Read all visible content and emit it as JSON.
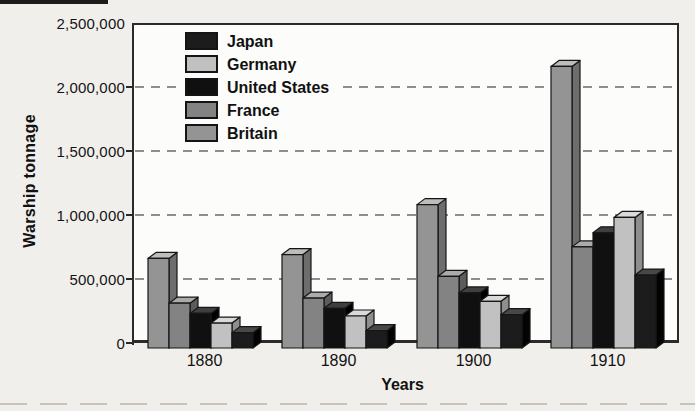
{
  "chart_data": {
    "type": "bar",
    "title": "",
    "xlabel": "Years",
    "ylabel": "Warship tonnage",
    "ylim": [
      0,
      2500000
    ],
    "grid": "horizontal-dashed",
    "legend_position": "top-left-inside",
    "yticks": [
      {
        "value": 0,
        "label": "0"
      },
      {
        "value": 500000,
        "label": "500,000"
      },
      {
        "value": 1000000,
        "label": "1,000,000"
      },
      {
        "value": 1500000,
        "label": "1,500,000"
      },
      {
        "value": 2000000,
        "label": "2,000,000"
      },
      {
        "value": 2500000,
        "label": "2,500,000"
      }
    ],
    "categories": [
      "1880",
      "1890",
      "1900",
      "1910"
    ],
    "series": [
      {
        "name": "Britain",
        "color_front": "#949494",
        "color_top": "#bdbdbd",
        "color_side": "#6d6d6d",
        "values": [
          700000,
          730000,
          1120000,
          2200000
        ]
      },
      {
        "name": "France",
        "color_front": "#838383",
        "color_top": "#ababab",
        "color_side": "#5c5c5c",
        "values": [
          350000,
          390000,
          560000,
          790000
        ]
      },
      {
        "name": "United States",
        "color_front": "#101010",
        "color_top": "#3f3f3f",
        "color_side": "#000000",
        "values": [
          270000,
          310000,
          430000,
          900000
        ]
      },
      {
        "name": "Germany",
        "color_front": "#c1c1c1",
        "color_top": "#dadada",
        "color_side": "#8e8e8e",
        "values": [
          195000,
          250000,
          365000,
          1020000
        ]
      },
      {
        "name": "Japan",
        "color_front": "#1c1c1c",
        "color_top": "#484848",
        "color_side": "#030303",
        "values": [
          120000,
          135000,
          260000,
          570000
        ]
      }
    ],
    "legend_order": [
      "Japan",
      "Germany",
      "United States",
      "France",
      "Britain"
    ],
    "style": {
      "bar_outline_color": "#161616",
      "gridline_color": "#8d8d8d",
      "axis_color": "#2a2a2a",
      "plot_background": "#fcfcfa",
      "page_background": "#f1efeb"
    }
  }
}
